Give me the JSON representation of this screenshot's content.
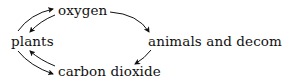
{
  "diagram": {
    "title": "",
    "nodes": {
      "oxygen": "oxygen",
      "plants": "plants",
      "animals": "animals and decomposers",
      "co2": "carbon dioxide"
    },
    "edges": [
      {
        "from": "plants",
        "to": "oxygen"
      },
      {
        "from": "oxygen",
        "to": "plants"
      },
      {
        "from": "plants",
        "to": "carbon dioxide"
      },
      {
        "from": "carbon dioxide",
        "to": "plants"
      },
      {
        "from": "oxygen",
        "to": "animals and decomposers"
      },
      {
        "from": "animals and decomposers",
        "to": "carbon dioxide"
      }
    ],
    "colors": {
      "text": "#111111",
      "arrow": "#111111",
      "background": "#ffffff"
    }
  }
}
